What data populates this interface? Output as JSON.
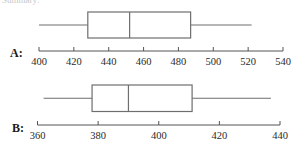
{
  "fragment_text": "Summary:",
  "chart_data": [
    {
      "type": "boxplot",
      "label": "A:",
      "axis": {
        "min": 400,
        "max": 540,
        "ticks": [
          400,
          420,
          440,
          460,
          480,
          500,
          520,
          540
        ]
      },
      "five_number_summary": {
        "min": 400,
        "q1": 428,
        "median": 452,
        "q3": 487,
        "max": 522
      },
      "grid": false
    },
    {
      "type": "boxplot",
      "label": "B:",
      "axis": {
        "min": 360,
        "max": 440,
        "ticks": [
          360,
          380,
          400,
          420,
          440
        ]
      },
      "five_number_summary": {
        "min": 362,
        "q1": 378,
        "median": 390,
        "q3": 411,
        "max": 437
      },
      "grid": false
    }
  ],
  "colors": {
    "line": "#6e6e6e",
    "axis": "#555555",
    "text": "#1a1a1a"
  }
}
